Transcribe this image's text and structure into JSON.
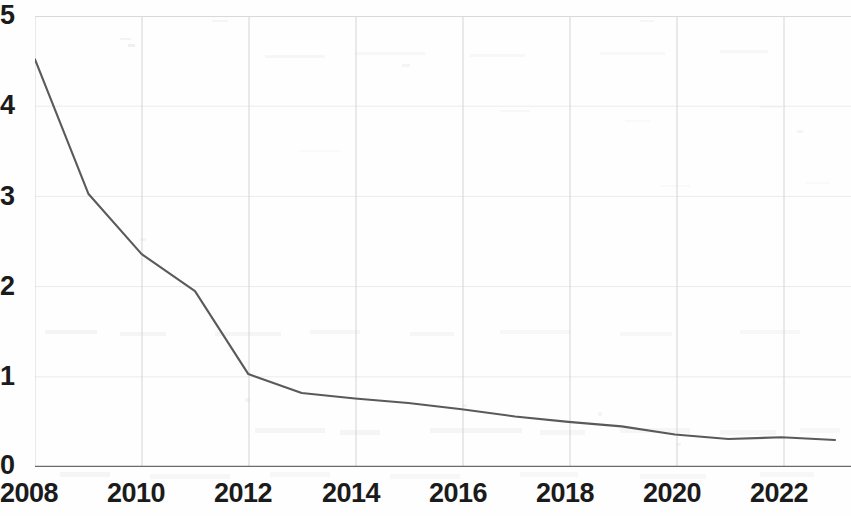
{
  "chart_data": {
    "type": "line",
    "title": "",
    "subtitle": "",
    "xlabel": "",
    "ylabel": "",
    "x": [
      2008,
      2009,
      2010,
      2011,
      2012,
      2013,
      2014,
      2015,
      2016,
      2017,
      2018,
      2019,
      2020,
      2021,
      2022,
      2023
    ],
    "values": [
      4.52,
      3.03,
      2.36,
      1.95,
      1.03,
      0.82,
      0.76,
      0.71,
      0.64,
      0.56,
      0.5,
      0.45,
      0.36,
      0.31,
      0.33,
      0.3
    ],
    "series": [
      {
        "name": "",
        "values": [
          4.52,
          3.03,
          2.36,
          1.95,
          1.03,
          0.82,
          0.76,
          0.71,
          0.64,
          0.56,
          0.5,
          0.45,
          0.36,
          0.31,
          0.33,
          0.3
        ]
      }
    ],
    "xlim": [
      2008,
      2023.3
    ],
    "ylim": [
      0,
      5
    ],
    "y_ticks": [
      "0",
      "1",
      "2",
      "3",
      "4",
      "5"
    ],
    "y_tick_values": [
      0,
      1,
      2,
      3,
      4,
      5
    ],
    "x_ticks": [
      "2008",
      "2010",
      "2012",
      "2014",
      "2016",
      "2018",
      "2020",
      "2022"
    ],
    "x_tick_values": [
      2008,
      2010,
      2012,
      2014,
      2016,
      2018,
      2020,
      2022
    ],
    "grid": "both-faint",
    "grid_vertical_color": "#d4d4d4",
    "grid_horizontal_color": "#ebebeb",
    "legend": "none",
    "line_color": "#5a5a5a",
    "axis_color": "#6b6b6b",
    "tick_label_color": "#1b1b1b",
    "annotations": []
  },
  "axes": {
    "y_labels": [
      {
        "text": "5",
        "value": 5
      },
      {
        "text": "4",
        "value": 4
      },
      {
        "text": "3",
        "value": 3
      },
      {
        "text": "2",
        "value": 2
      },
      {
        "text": "1",
        "value": 1
      },
      {
        "text": "0",
        "value": 0
      }
    ],
    "x_labels": [
      {
        "text": "2008",
        "value": 2008
      },
      {
        "text": "2010",
        "value": 2010
      },
      {
        "text": "2012",
        "value": 2012
      },
      {
        "text": "2014",
        "value": 2014
      },
      {
        "text": "2016",
        "value": 2016
      },
      {
        "text": "2018",
        "value": 2018
      },
      {
        "text": "2020",
        "value": 2020
      },
      {
        "text": "2022",
        "value": 2022
      }
    ]
  }
}
